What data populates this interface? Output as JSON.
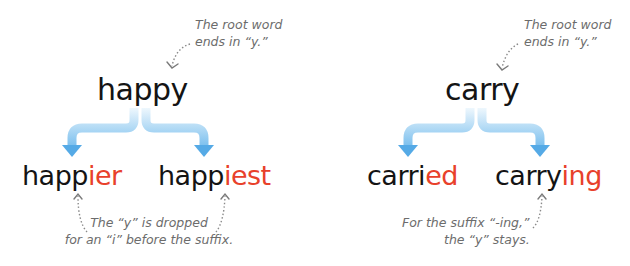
{
  "colors": {
    "root_text": "#141414",
    "suffix": "#e8412b",
    "note_text": "#6c6c6c",
    "arrow_light": "#dff0fb",
    "arrow_dark": "#5aaee8"
  },
  "panels": [
    {
      "root": "happy",
      "top_note": [
        "The root word",
        "ends in “y.”"
      ],
      "derived": [
        {
          "stem": "happ",
          "suffix": "ier"
        },
        {
          "stem": "happ",
          "suffix": "iest"
        }
      ],
      "bottom_note": [
        "The “y” is dropped",
        "for an “i” before the suffix."
      ]
    },
    {
      "root": "carry",
      "top_note": [
        "The root word",
        "ends in “y.”"
      ],
      "derived": [
        {
          "stem": "carri",
          "suffix": "ed"
        },
        {
          "stem": "carry",
          "suffix": "ing"
        }
      ],
      "bottom_note": [
        "For the suffix “-ing,”",
        "the “y” stays."
      ]
    }
  ]
}
